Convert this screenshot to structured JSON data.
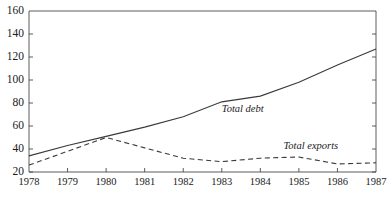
{
  "chart_data": {
    "type": "line",
    "title": "",
    "xlabel": "",
    "ylabel": "",
    "x": [
      1978,
      1979,
      1980,
      1981,
      1982,
      1983,
      1984,
      1985,
      1986,
      1987
    ],
    "categories": [
      "1978",
      "1979",
      "1980",
      "1981",
      "1982",
      "1983",
      "1984",
      "1985",
      "1986",
      "1987"
    ],
    "xlim": [
      1978,
      1987
    ],
    "ylim": [
      20,
      160
    ],
    "yticks": [
      20,
      40,
      60,
      80,
      100,
      120,
      140,
      160
    ],
    "ytick_labels": [
      "20",
      "40",
      "60",
      "80",
      "100",
      "120",
      "140",
      "160"
    ],
    "grid": false,
    "legend": "inline-annotations",
    "series": [
      {
        "name": "Total debt",
        "style": "solid",
        "color": "#3a3a3a",
        "values": [
          34,
          43,
          51,
          59,
          68,
          81,
          86,
          98,
          113,
          127
        ]
      },
      {
        "name": "Total exports",
        "style": "dashed",
        "color": "#3a3a3a",
        "values": [
          26,
          38,
          50,
          41,
          32,
          29,
          32,
          33,
          27,
          28
        ]
      }
    ],
    "annotations": [
      {
        "text": "Total debt",
        "x": 1983.0,
        "y": 74
      },
      {
        "text": "Total exports",
        "x": 1984.6,
        "y": 42
      }
    ]
  },
  "axes": {
    "y_axis_name": "value-axis",
    "x_axis_name": "year-axis"
  }
}
